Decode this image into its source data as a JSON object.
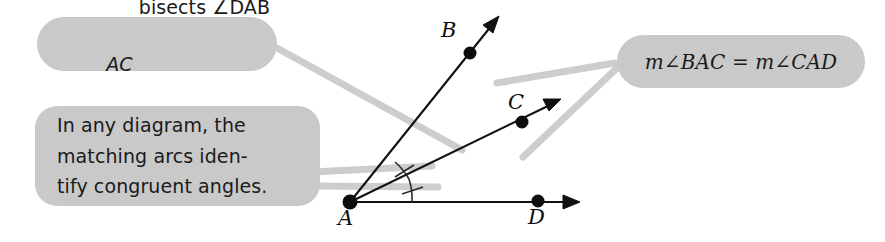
{
  "figure": {
    "background_color": "#ffffff",
    "callout_fill": "#c9c9c9",
    "ink_color": "#0d0d0d",
    "connector_color": "#cdcdcd"
  },
  "callouts": {
    "bisects": {
      "ray_label": "AC",
      "text": " bisects ∠DAB",
      "full_text": "AC bisects ∠DAB"
    },
    "arcs": {
      "line1": "In any diagram, the",
      "line2": "matching arcs iden-",
      "line3": "tify congruent angles."
    },
    "equal": {
      "text": "m∠BAC = m∠CAD"
    }
  },
  "diagram": {
    "vertex_label": "A",
    "points": [
      {
        "name": "A",
        "label": "A",
        "x": 350,
        "y": 202
      },
      {
        "name": "B",
        "label": "B",
        "x": 470,
        "y": 53
      },
      {
        "name": "C",
        "label": "C",
        "x": 522,
        "y": 122
      },
      {
        "name": "D",
        "label": "D",
        "x": 538,
        "y": 201
      }
    ],
    "rays": [
      {
        "name": "ray-AB",
        "from": "A",
        "through": "B"
      },
      {
        "name": "ray-AC",
        "from": "A",
        "through": "C"
      },
      {
        "name": "ray-AD",
        "from": "A",
        "through": "D"
      }
    ],
    "angle_marks": [
      {
        "name": "arc-BAC",
        "ticks": 1
      },
      {
        "name": "arc-CAD",
        "ticks": 1
      }
    ]
  }
}
